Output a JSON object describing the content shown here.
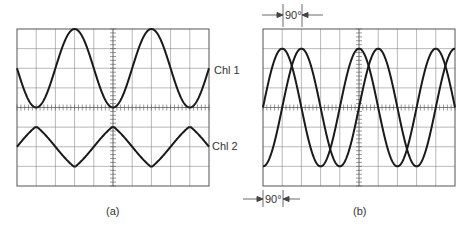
{
  "figure": {
    "panels": [
      {
        "id": "a",
        "caption": "(a)",
        "grid": {
          "cols": 10,
          "rows": 8
        },
        "traces": [
          {
            "label": "Chl 1",
            "shape": "sine",
            "amplitude_div": 2,
            "offset_div": 2,
            "period_div": 4,
            "phase_deg": 0
          },
          {
            "label": "Chl 2",
            "shape": "triangle",
            "amplitude_div": 1,
            "offset_div": -2,
            "period_div": 4,
            "phase_deg": 180
          }
        ]
      },
      {
        "id": "b",
        "caption": "(b)",
        "grid": {
          "cols": 10,
          "rows": 8
        },
        "traces": [
          {
            "label": "",
            "shape": "sine",
            "amplitude_div": 3,
            "offset_div": 0,
            "period_div": 4,
            "phase_deg": 0
          },
          {
            "label": "",
            "shape": "sine",
            "amplitude_div": 3,
            "offset_div": 0,
            "period_div": 4,
            "phase_deg": -90
          }
        ],
        "annotations": [
          {
            "text": "90°",
            "position": "top"
          },
          {
            "text": "90°",
            "position": "bottom"
          }
        ]
      }
    ]
  },
  "labels": {
    "ch1": "Chl 1",
    "ch2": "Chl 2",
    "cap_a": "(a)",
    "cap_b": "(b)",
    "phase_top": "90°",
    "phase_bottom": "90°"
  },
  "colors": {
    "trace": "#1a1a1a",
    "grid": "#8a8a8a",
    "border": "#555555"
  }
}
